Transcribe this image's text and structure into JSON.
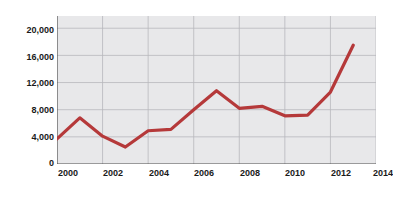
{
  "chart_data": {
    "type": "line",
    "title": "",
    "xlabel": "Year",
    "ylabel": "Number of deaths",
    "x": [
      2000,
      2001,
      2002,
      2003,
      2004,
      2005,
      2006,
      2007,
      2008,
      2009,
      2010,
      2011,
      2012,
      2013
    ],
    "values": [
      3700,
      6800,
      4100,
      2500,
      4900,
      5100,
      8000,
      10800,
      8200,
      8500,
      7100,
      7200,
      10600,
      17500
    ],
    "series": [
      {
        "name": "Number of deaths",
        "values": [
          3700,
          6800,
          4100,
          2500,
          4900,
          5100,
          8000,
          10800,
          8200,
          8500,
          7100,
          7200,
          10600,
          17500
        ]
      }
    ],
    "xlim": [
      2000,
      2014
    ],
    "ylim": [
      0,
      21800
    ],
    "xticks": [
      2000,
      2002,
      2004,
      2006,
      2008,
      2010,
      2012,
      2014
    ],
    "xtick_labels": [
      "2000",
      "2002",
      "2004",
      "2006",
      "2008",
      "2010",
      "2012",
      "2014"
    ],
    "yticks": [
      0,
      4000,
      8000,
      12000,
      16000,
      20000
    ],
    "ytick_labels": [
      "0",
      "4,000",
      "8,000",
      "12,000",
      "16,000",
      "20,000"
    ],
    "grid": true,
    "grid_axis": "both",
    "legend": false,
    "legend_position": "none",
    "line_color": "#b5393a",
    "line_width": 3.2,
    "plot_background": "#e8e8ea",
    "grid_color": "#b8b8bc",
    "axis_color": "#4d4d4d",
    "figure_background": "#ffffff",
    "last_xtick_clipped": true
  }
}
